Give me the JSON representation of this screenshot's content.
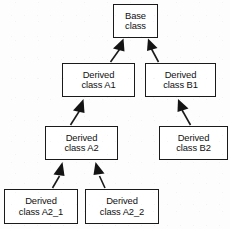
{
  "diagram": {
    "type": "class-hierarchy",
    "title": "",
    "background_color": "#fdfdfd",
    "line_color": "#1a1a1a",
    "box_fill_color": "#ffffff",
    "arrow_style": "solid-filled-triangle",
    "arrow_direction": "child-to-parent",
    "nodes": [
      {
        "id": "base",
        "line1": "Base",
        "line2": "class",
        "x": 113,
        "y": 4,
        "w": 45,
        "h": 34
      },
      {
        "id": "a1",
        "line1": "Derived",
        "line2": "class A1",
        "x": 62,
        "y": 63,
        "w": 73,
        "h": 34
      },
      {
        "id": "b1",
        "line1": "Derived",
        "line2": "class B1",
        "x": 145,
        "y": 63,
        "w": 71,
        "h": 34
      },
      {
        "id": "a2",
        "line1": "Derived",
        "line2": "class A2",
        "x": 45,
        "y": 126,
        "w": 73,
        "h": 34
      },
      {
        "id": "b2",
        "line1": "Derived",
        "line2": "class B2",
        "x": 159,
        "y": 126,
        "w": 69,
        "h": 34
      },
      {
        "id": "a2_1",
        "line1": "Derived",
        "line2": "class A2_1",
        "x": 4,
        "y": 189,
        "w": 74,
        "h": 35
      },
      {
        "id": "a2_2",
        "line1": "Derived",
        "line2": "class A2_2",
        "x": 85,
        "y": 189,
        "w": 74,
        "h": 35
      }
    ],
    "edges": [
      {
        "id": "a1-to-base",
        "from": "a1",
        "to": "base",
        "label": ""
      },
      {
        "id": "b1-to-base",
        "from": "b1",
        "to": "base",
        "label": ""
      },
      {
        "id": "a2-to-a1",
        "from": "a2",
        "to": "a1",
        "label": ""
      },
      {
        "id": "b2-to-b1",
        "from": "b2",
        "to": "b1",
        "label": ""
      },
      {
        "id": "a2_1-to-a2",
        "from": "a2_1",
        "to": "a2",
        "label": ""
      },
      {
        "id": "a2_2-to-a2",
        "from": "a2_2",
        "to": "a2",
        "label": ""
      }
    ]
  }
}
